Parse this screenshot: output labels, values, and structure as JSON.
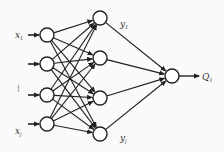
{
  "diagram": {
    "type": "neural-network",
    "input_labels": [
      {
        "main": "x",
        "sub": "1"
      },
      {
        "main": "",
        "sub": ""
      },
      {
        "main": "......",
        "sub": ""
      },
      {
        "main": "x",
        "sub": "j"
      }
    ],
    "input_count": 4,
    "hidden_count": 4,
    "output_count": 1,
    "hidden_labels": {
      "top": {
        "main": "y",
        "sub": "1"
      },
      "bottom": {
        "main": "y",
        "sub": "j"
      }
    },
    "output_label": {
      "main": "Q",
      "sub": "1"
    },
    "colors": {
      "stroke": "#222222",
      "node_fill": "#ffffff"
    }
  }
}
